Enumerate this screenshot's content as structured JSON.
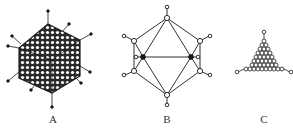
{
  "figures": [
    {
      "id": "A",
      "label": "A",
      "description": "icosahedral virus capsid with capsomeres and fibers",
      "label_x": 53,
      "label_y": 113
    },
    {
      "id": "B",
      "label": "B",
      "description": "icosahedron wireframe with vertex pentons",
      "label_x": 167,
      "label_y": 113
    },
    {
      "id": "C",
      "label": "C",
      "description": "triangular face showing capsomere packing",
      "label_x": 264,
      "label_y": 113
    }
  ],
  "colors": {
    "ink": "#1a1a1a",
    "capsid_fill": "#2a2a2a",
    "capsomere": "#ffffff",
    "background": "#ffffff"
  }
}
